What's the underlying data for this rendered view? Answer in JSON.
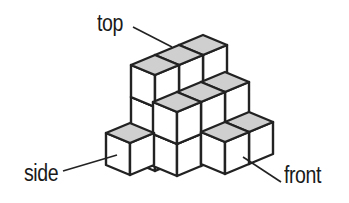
{
  "diagram": {
    "type": "isometric cube structure",
    "labels": {
      "top": "top",
      "side": "side",
      "front": "front"
    },
    "colors": {
      "top_face": "#cfcfcf",
      "side_face": "#ffffff",
      "front_face": "#ffffff",
      "edge": "#222222"
    },
    "cubes": [
      {
        "x": 203,
        "y": 151,
        "h": 3
      },
      {
        "x": 179,
        "y": 161,
        "h": 3
      },
      {
        "x": 155,
        "y": 171,
        "h": 3
      },
      {
        "x": 225,
        "y": 156,
        "h": 2
      },
      {
        "x": 201,
        "y": 166,
        "h": 2
      },
      {
        "x": 177,
        "y": 176,
        "h": 2
      },
      {
        "x": 130,
        "y": 175,
        "h": 1
      },
      {
        "x": 249,
        "y": 164,
        "h": 1
      },
      {
        "x": 225,
        "y": 174,
        "h": 1
      }
    ],
    "leaders": {
      "top": [
        133,
        27,
        172,
        47
      ],
      "side": [
        63,
        171,
        117,
        155
      ],
      "front": [
        243,
        157,
        281,
        182
      ]
    }
  }
}
